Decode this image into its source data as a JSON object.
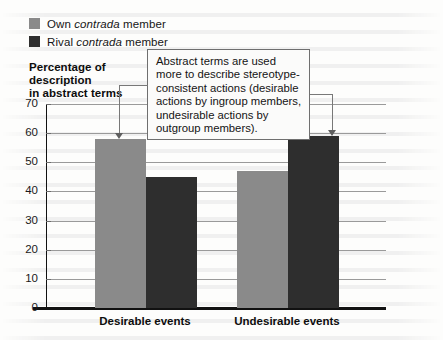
{
  "chart_data": {
    "type": "bar",
    "title": "",
    "subtitle": "",
    "xlabel": "",
    "ylabel": "Percentage of description in abstract terms",
    "ylabel_lines": [
      "Percentage of",
      "description",
      "in abstract terms"
    ],
    "categories": [
      "Desirable events",
      "Undesirable events"
    ],
    "series": [
      {
        "name": "Own contrada member",
        "color": "#8a8a8a",
        "values": [
          58,
          47
        ]
      },
      {
        "name": "Rival contrada member",
        "color": "#2e2e2e",
        "values": [
          45,
          59
        ]
      }
    ],
    "ylim": [
      0,
      70
    ],
    "yticks": [
      0,
      10,
      20,
      30,
      40,
      50,
      60,
      70
    ],
    "ytick_labels": [
      "0",
      "10",
      "20",
      "30",
      "40",
      "50",
      "60",
      "70"
    ],
    "grid": true,
    "grid_axis": "y",
    "legend_position": "top-left",
    "annotations": [
      {
        "text": "Abstract terms are used more to describe stereotype-consistent actions (desirable actions by ingroup members, undesirable actions by outgroup members).",
        "points_to": [
          "Own contrada member / Desirable events",
          "Rival contrada member / Undesirable events"
        ]
      }
    ]
  },
  "legend": {
    "items": [
      {
        "prefix": "Own ",
        "emphasis": "contrada",
        "suffix": " member",
        "color": "#8a8a8a"
      },
      {
        "prefix": "Rival ",
        "emphasis": "contrada",
        "suffix": " member",
        "color": "#2e2e2e"
      }
    ]
  },
  "axis": {
    "y_title_line1": "Percentage of",
    "y_title_line2": "description",
    "y_title_line3": "in abstract terms",
    "y_ticks": [
      "70",
      "60",
      "50",
      "40",
      "30",
      "20",
      "10",
      "0"
    ]
  },
  "x_categories": {
    "left": "Desirable events",
    "right": "Undesirable events"
  },
  "callout": {
    "text": "Abstract terms are used more to describe stereotype-consistent actions (desirable actions by ingroup members, undesirable actions by outgroup members)."
  },
  "colors": {
    "own": "#8a8a8a",
    "rival": "#2e2e2e",
    "axis": "#111111",
    "gridline": "#9a9a9a",
    "callout_border": "#6f6f6f",
    "connector": "#787878",
    "background": "#fdfdfc"
  }
}
